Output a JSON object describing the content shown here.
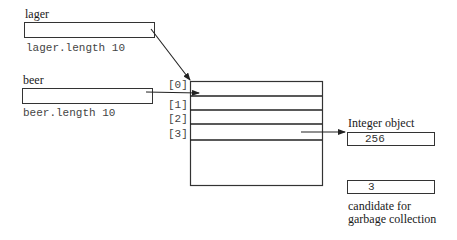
{
  "variables": {
    "lager": {
      "name": "lager",
      "length_label": "lager.length 10"
    },
    "beer": {
      "name": "beer",
      "length_label": "beer.length 10"
    }
  },
  "array": {
    "indices": [
      "[0]",
      "[1]",
      "[2]",
      "[3]"
    ],
    "slot_count_visible": 4
  },
  "objects": {
    "integer_object": {
      "label": "Integer object",
      "value": "256"
    },
    "orphan": {
      "value": "3",
      "caption_line1": "candidate for",
      "caption_line2": "garbage collection"
    }
  },
  "colors": {
    "stroke": "#333333",
    "background": "#ffffff"
  }
}
